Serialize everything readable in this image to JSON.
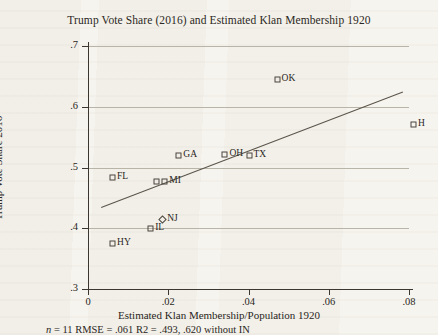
{
  "chart_data": {
    "type": "scatter",
    "title": "Trump Vote Share (2016) and Estimated Klan Membership 1920",
    "xlabel": "Estimated Klan Membership/Population 1920",
    "ylabel": "Trump Vote Share 2016",
    "xlim": [
      0,
      0.08
    ],
    "ylim": [
      0.3,
      0.7
    ],
    "xticks": [
      "0",
      ".02",
      ".04",
      ".06",
      ".08"
    ],
    "xtick_values": [
      0,
      0.02,
      0.04,
      0.06,
      0.08
    ],
    "yticks": [
      ".7",
      ".6",
      ".5",
      ".4",
      ".3"
    ],
    "ytick_values": [
      0.7,
      0.6,
      0.5,
      0.4,
      0.3
    ],
    "grid": "horizontal",
    "legend": "none",
    "points": [
      {
        "label": "HY",
        "x": 0.006,
        "y": 0.375,
        "label_side": "right"
      },
      {
        "label": "FL",
        "x": 0.006,
        "y": 0.485,
        "label_side": "right"
      },
      {
        "label": "IL",
        "x": 0.0155,
        "y": 0.4,
        "label_side": "right"
      },
      {
        "label": "",
        "x": 0.017,
        "y": 0.478,
        "label_side": "right"
      },
      {
        "label": "NJ",
        "x": 0.0185,
        "y": 0.415,
        "label_side": "right"
      },
      {
        "label": "MI",
        "x": 0.019,
        "y": 0.478,
        "label_side": "right"
      },
      {
        "label": "GA",
        "x": 0.0225,
        "y": 0.52,
        "label_side": "right"
      },
      {
        "label": "OH",
        "x": 0.034,
        "y": 0.522,
        "label_side": "right"
      },
      {
        "label": "TX",
        "x": 0.04,
        "y": 0.52,
        "label_side": "right"
      },
      {
        "label": "OK",
        "x": 0.047,
        "y": 0.645,
        "label_side": "right"
      },
      {
        "label": "H",
        "x": 0.081,
        "y": 0.572,
        "label_side": "right"
      }
    ],
    "fit_line": {
      "x0": 0.0033,
      "y0": 0.435,
      "x1": 0.0785,
      "y1": 0.625
    },
    "annotation": "n = 11  RMSE = .061 R2 = .493, .620 without IN",
    "annotation_n": "n",
    "annotation_rest": " = 11  RMSE = .061 R2 = .493, .620 without IN"
  },
  "colors": {
    "paper": "#f6f4ee",
    "ink": "#2a2622",
    "grid": "#b9b4a8",
    "axis": "#3b3730",
    "marker": "#4a453c",
    "fit": "#5a544a"
  }
}
